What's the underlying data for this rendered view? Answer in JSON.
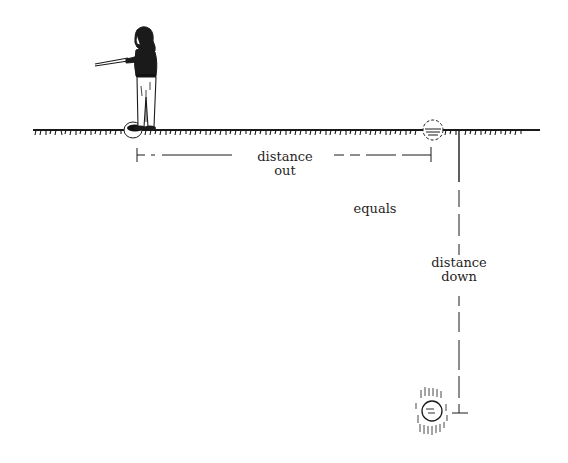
{
  "diagram": {
    "type": "illustration",
    "labels": {
      "distance_out": [
        "distance",
        "out"
      ],
      "equals": "equals",
      "distance_down": [
        "distance",
        "down"
      ]
    },
    "elements": {
      "person": "person-holding-dowsing-rods",
      "ground_line": "hatched-ground-surface",
      "start_marker": "circle-at-feet",
      "surface_marker": "dashed-circle-on-ground",
      "target": "hatched-circle-underground"
    },
    "colors": {
      "ink": "#1a1a1a",
      "background": "#ffffff"
    }
  }
}
